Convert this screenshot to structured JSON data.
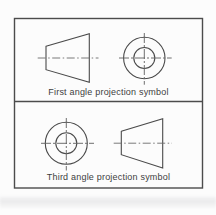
{
  "diagram": {
    "panels": [
      {
        "caption": "First angle projection symbol",
        "left_symbol": "truncated-cone-side-view",
        "right_symbol": "concentric-circles-end-view"
      },
      {
        "caption": "Third angle projection symbol",
        "left_symbol": "concentric-circles-end-view",
        "right_symbol": "truncated-cone-side-view"
      }
    ]
  },
  "colors": {
    "outline": "#4a4a4a",
    "centerline": "#6b6b6b",
    "border": "#4c4c4c",
    "text": "#3e3e3e",
    "background": "#fcfcfc",
    "scan_shadow": "#cdcdd0"
  }
}
